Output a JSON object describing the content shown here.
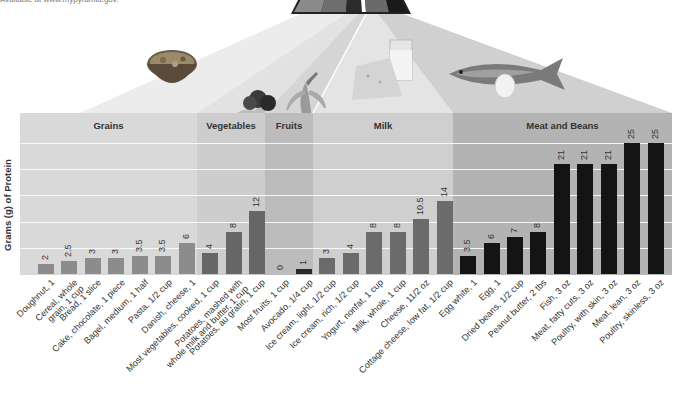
{
  "source_note": "Available at www.mypyramid.gov.",
  "colors": {
    "grains_band": "#d9d9d9",
    "vegetables_band": "#cdcdcd",
    "fruits_band": "#bcbcbc",
    "milk_band": "#cfcfcf",
    "meat_band": "#b3b3b3",
    "grains_bar": "#8c8c8c",
    "vegetables_bar": "#666666",
    "fruits_bar": "#2a2a2a",
    "milk_bar": "#6b6b6b",
    "meat_bar": "#141414",
    "pyramid_stripes": [
      "#8a8a8a",
      "#6e6e6e",
      "#2c2c2c",
      "#ffffff",
      "#6a6a6a",
      "#1a1a1a"
    ]
  },
  "food_images": [
    "cereal-bowl-icon",
    "broccoli-icon",
    "banana-icon",
    "milk-cheese-icon",
    "fish-egg-icon"
  ],
  "chart_data": {
    "type": "bar",
    "title": "",
    "xlabel": "",
    "ylabel": "Grams (g) of Protein",
    "ylim": [
      0,
      25
    ],
    "grid": true,
    "gridlines": [
      5,
      10,
      15,
      20,
      25
    ],
    "groups": [
      {
        "name": "Grains",
        "start": 0,
        "end": 7
      },
      {
        "name": "Vegetables",
        "start": 7,
        "end": 10
      },
      {
        "name": "Fruits",
        "start": 10,
        "end": 12
      },
      {
        "name": "Milk",
        "start": 12,
        "end": 18
      },
      {
        "name": "Meat and Beans",
        "start": 18,
        "end": 27
      }
    ],
    "categories": [
      "Doughnut, 1",
      "Cereal, whole\ngrain, 1 cup",
      "Bread, 1 slice",
      "Cake, chocolate, 1 piece",
      "Bagel, medium, 1 half",
      "Pasta, 1/2 cup",
      "Danish, cheese, 1",
      "Most vegetables, cooked, 1 cup",
      "Potatoes, mashed with\nwhole milk and butter, 1 cup",
      "Potatoes, au gratin, 1 cup",
      "Most fruits, 1 cup",
      "Avocado, 1/4 cup",
      "Ice cream, light, 1/2 cup",
      "Ice cream, rich, 1/2 cup",
      "Yogurt, nonfat, 1 cup",
      "Milk, whole, 1 cup",
      "Cheese, 11/2 oz",
      "Cottage cheese, low fat, 1/2 cup",
      "Egg white, 1",
      "Egg, 1",
      "Dried beans, 1/2 cup",
      "Peanut butter, 2 tbs",
      "Fish, 3 oz",
      "Meat, fatty cuts, 3 oz",
      "Poultry, with skin, 3 oz",
      "Meat, lean, 3 oz",
      "Poultry, skinless, 3 oz"
    ],
    "values": [
      2,
      2.5,
      3,
      3,
      3.5,
      3.5,
      6,
      4,
      8,
      12,
      0,
      1,
      3,
      4,
      8,
      8,
      10.5,
      14,
      3.5,
      6,
      7,
      8,
      21,
      21,
      21,
      25,
      25
    ],
    "value_labels": [
      "2",
      "2.5",
      "3",
      "3",
      "3.5",
      "3.5",
      "6",
      "4",
      "8",
      "12",
      "0",
      "1",
      "3",
      "4",
      "8",
      "8",
      "10.5",
      "14",
      "3.5",
      "6",
      "7",
      "8",
      "21",
      "21",
      "21",
      "25",
      "25"
    ],
    "legend": []
  }
}
